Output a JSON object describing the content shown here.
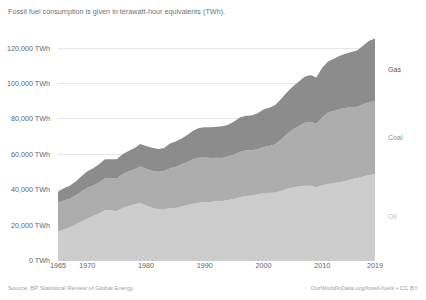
{
  "subtitle": "Fossil fuel consumption is given in terawatt-hour equivalents (TWh).",
  "footer": {
    "source": "Source: BP Statistical Review of Global Energy",
    "credit": "OurWorldInData.org/fossil-fuels • CC BY"
  },
  "series_labels": {
    "gas": "Gas",
    "coal": "Coal",
    "oil": "Oil"
  },
  "colors": {
    "gas": "#8c8c8c",
    "coal": "#adadad",
    "oil": "#cdcdcd",
    "gridline": "#e4e7e9",
    "baseline": "#c9ced1",
    "axis_text": "#5d666c",
    "subtitle_text": "#6a7379",
    "footer_text": "#9aa2a7",
    "gas_label": "#555555",
    "coal_label": "#8a8a8a",
    "oil_label": "#bdbdbd"
  },
  "chart_data": {
    "type": "area",
    "stacked": true,
    "title": "",
    "subtitle": "Fossil fuel consumption is given in terawatt-hour equivalents (TWh).",
    "xlabel": "",
    "ylabel": "",
    "xlim": [
      1965,
      2019
    ],
    "ylim": [
      0,
      130000
    ],
    "grid": true,
    "legend_position": "right-inline",
    "y_ticks": [
      0,
      20000,
      40000,
      60000,
      80000,
      100000,
      120000
    ],
    "y_tick_labels": [
      "0 TWh",
      "20,000 TWh",
      "40,000 TWh",
      "60,000 TWh",
      "80,000 TWh",
      "100,000 TWh",
      "120,000 TWh"
    ],
    "x_ticks": [
      1965,
      1970,
      1980,
      1990,
      2000,
      2010,
      2019
    ],
    "x_tick_labels": [
      "1965",
      "1970",
      "1980",
      "1990",
      "2000",
      "2010",
      "2019"
    ],
    "x": [
      1965,
      1966,
      1967,
      1968,
      1969,
      1970,
      1971,
      1972,
      1973,
      1974,
      1975,
      1976,
      1977,
      1978,
      1979,
      1980,
      1981,
      1982,
      1983,
      1984,
      1985,
      1986,
      1987,
      1988,
      1989,
      1990,
      1991,
      1992,
      1993,
      1994,
      1995,
      1996,
      1997,
      1998,
      1999,
      2000,
      2001,
      2002,
      2003,
      2004,
      2005,
      2006,
      2007,
      2008,
      2009,
      2010,
      2011,
      2012,
      2013,
      2014,
      2015,
      2016,
      2017,
      2018,
      2019
    ],
    "series": [
      {
        "name": "Oil",
        "color": "#cdcdcd",
        "stack_order": 1,
        "values": [
          16100,
          17300,
          18500,
          20000,
          21700,
          23500,
          24800,
          26300,
          28200,
          28000,
          27700,
          29400,
          30400,
          31500,
          32200,
          30800,
          29600,
          28800,
          28500,
          29200,
          29200,
          30200,
          30900,
          31800,
          32400,
          32700,
          32800,
          33300,
          33300,
          33900,
          34500,
          35400,
          36200,
          36400,
          37200,
          37600,
          37800,
          38200,
          39000,
          40300,
          41000,
          41500,
          42000,
          41900,
          41100,
          42300,
          42900,
          43500,
          44000,
          44600,
          45600,
          46400,
          47200,
          48000,
          48400
        ]
      },
      {
        "name": "Coal",
        "color": "#adadad",
        "stack_order": 2,
        "values": [
          16100,
          16300,
          16100,
          16500,
          17000,
          17400,
          17300,
          17500,
          18000,
          18100,
          18400,
          19000,
          19600,
          19700,
          20600,
          20800,
          20900,
          21100,
          21600,
          22500,
          23400,
          23800,
          24500,
          25100,
          25400,
          25200,
          24900,
          24500,
          24400,
          24600,
          25200,
          25700,
          25900,
          25600,
          25400,
          26200,
          26700,
          27200,
          29100,
          30900,
          32700,
          34100,
          35600,
          36100,
          36000,
          38200,
          40400,
          40700,
          41400,
          41400,
          40800,
          40200,
          40800,
          41300,
          41300
        ]
      },
      {
        "name": "Gas",
        "color": "#8c8c8c",
        "stack_order": 3,
        "values": [
          6400,
          6900,
          7300,
          7900,
          8600,
          9200,
          9800,
          10300,
          10700,
          10900,
          10800,
          11400,
          11600,
          12000,
          12700,
          12800,
          12900,
          12900,
          13000,
          14000,
          14400,
          14500,
          15300,
          16100,
          16800,
          17100,
          17400,
          17500,
          17900,
          18000,
          18600,
          19500,
          19500,
          19700,
          20300,
          21200,
          21500,
          22200,
          22900,
          23600,
          24400,
          25100,
          26000,
          26600,
          26100,
          28100,
          28900,
          29500,
          30100,
          30600,
          31200,
          32000,
          33200,
          34600,
          35500
        ]
      }
    ],
    "totals_note": "Stacked total reaches approximately 125,200 TWh in 2019"
  }
}
